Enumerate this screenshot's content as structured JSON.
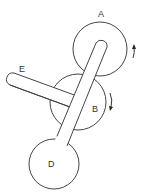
{
  "diagram": {
    "type": "mechanical-linkage",
    "stroke_color": "#444444",
    "fill_color": "#ffffff",
    "parts": {
      "wheel_a": {
        "label": "A",
        "cx": 100,
        "cy": 50,
        "r": 27,
        "rotation": "counterclockwise-arrow-up"
      },
      "wheel_b": {
        "label": "B",
        "cx": 78,
        "cy": 102,
        "r": 28,
        "rotation": "clockwise-arrow-down"
      },
      "weight_d": {
        "label": "D",
        "cx": 54,
        "cy": 164,
        "r": 25
      },
      "arm_e": {
        "label": "E"
      }
    },
    "labels": {
      "a": "A",
      "b": "B",
      "d": "D",
      "e": "E"
    }
  }
}
